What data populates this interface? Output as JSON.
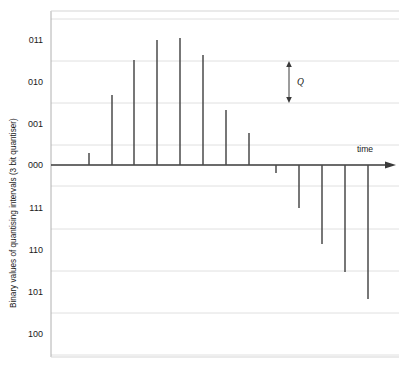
{
  "figure": {
    "background_color": "#ffffff",
    "frame_color": "#b9b9b9",
    "grid_color": "#dddddd",
    "stem_color": "#4a4a4a",
    "axis_color": "#3a3a3a",
    "text_color": "#1a1a1a",
    "plot_left": 51,
    "plot_right": 399,
    "plot_top": 11,
    "plot_bottom": 357
  },
  "axes": {
    "ylabel": "Binary values of quantising intervals (3 bit quantiser)",
    "xlabel": "time",
    "y_ticks": [
      {
        "label": "011",
        "y": 40
      },
      {
        "label": "010",
        "y": 82
      },
      {
        "label": "001",
        "y": 124
      },
      {
        "label": "000",
        "y": 165
      },
      {
        "label": "111",
        "y": 208
      },
      {
        "label": "110",
        "y": 250
      },
      {
        "label": "101",
        "y": 292
      },
      {
        "label": "100",
        "y": 334
      }
    ],
    "gridlines_y": [
      19,
      61,
      103,
      145,
      186,
      229,
      271,
      313,
      355
    ],
    "baseline_y": 165,
    "arrow_x_end": 396
  },
  "annotation": {
    "label": "Q",
    "label_x": 297,
    "label_y": 85,
    "arrow_x": 289,
    "arrow_top_y": 61,
    "arrow_bottom_y": 103
  },
  "chart_data": {
    "type": "bar",
    "title": "",
    "xlabel": "time",
    "ylabel": "Binary values of quantising intervals (3 bit quantiser)",
    "ytick_labels": [
      "011",
      "010",
      "001",
      "000",
      "111",
      "110",
      "101",
      "100"
    ],
    "ytick_values": [
      3,
      2,
      1,
      0,
      -1,
      -2,
      -3,
      -4
    ],
    "ylim": [
      -4.6,
      3.6
    ],
    "grid": true,
    "legend": null,
    "x": [
      66,
      89,
      112,
      134,
      157,
      180,
      203,
      226,
      249,
      276,
      299,
      322,
      345,
      368
    ],
    "categories": [
      "s1",
      "s2",
      "s3",
      "s4",
      "s5",
      "s6",
      "s7",
      "s8",
      "s9",
      "s10",
      "s11",
      "s12",
      "s13",
      "s14"
    ],
    "values": [
      0,
      0.28,
      1.68,
      2.52,
      3.0,
      3.05,
      2.35,
      1.08,
      0.46,
      -0.2,
      -1.05,
      -1.9,
      -2.55,
      -3.2
    ],
    "stems": [
      {
        "x": 66,
        "top_y": 165,
        "code": "000"
      },
      {
        "x": 89,
        "top_y": 153,
        "code": "000"
      },
      {
        "x": 112,
        "top_y": 95,
        "code": "001"
      },
      {
        "x": 134,
        "top_y": 60,
        "code": "010"
      },
      {
        "x": 157,
        "top_y": 40,
        "code": "011"
      },
      {
        "x": 180,
        "top_y": 38,
        "code": "011"
      },
      {
        "x": 203,
        "top_y": 55,
        "code": "010"
      },
      {
        "x": 226,
        "top_y": 110,
        "code": "001"
      },
      {
        "x": 249,
        "top_y": 133,
        "code": "001"
      },
      {
        "x": 276,
        "top_y": 173,
        "code": "000"
      },
      {
        "x": 299,
        "top_y": 208,
        "code": "111"
      },
      {
        "x": 322,
        "top_y": 244,
        "code": "110"
      },
      {
        "x": 345,
        "top_y": 272,
        "code": "110"
      },
      {
        "x": 368,
        "top_y": 299,
        "code": "101"
      }
    ],
    "negative_stem_start_index": 9
  }
}
